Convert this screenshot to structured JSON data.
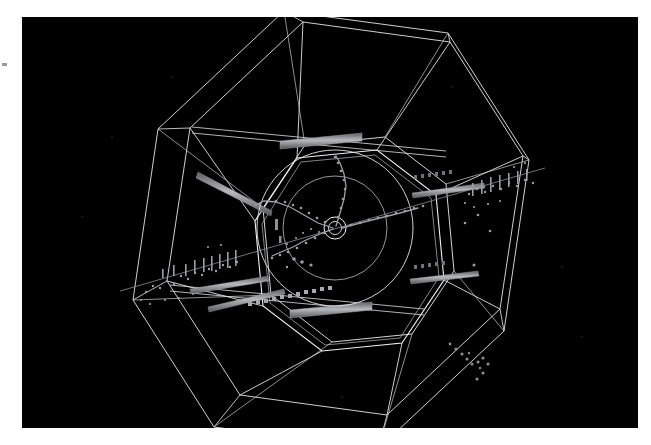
{
  "page": {
    "background_color": "#ffffff",
    "panel_background_color": "#000000",
    "wireframe_color": "#e8e8e8",
    "hit_color": "#9fa3a8",
    "track_color": "#b9bcc0",
    "calorimeter_bar_color": "#8e9196",
    "panel": {
      "x": 22,
      "y": 17,
      "width": 616,
      "height": 411
    }
  },
  "figure": {
    "kind": "particle-detector-event-display",
    "view": "end-on perspective, beam axis into the page",
    "interaction_point": {
      "x": 335,
      "y": 228
    }
  },
  "detector": {
    "sides": 8,
    "outer_octagon": {
      "name": "muon-chamber-outer-shell",
      "center": {
        "x": 333,
        "y": 230
      },
      "radius": 220,
      "rotation_deg": 22.5,
      "vertices": [
        {
          "x": 286,
          "y": 11
        },
        {
          "x": 450,
          "y": 33
        },
        {
          "x": 531,
          "y": 160
        },
        {
          "x": 506,
          "y": 331
        },
        {
          "x": 380,
          "y": 449
        },
        {
          "x": 216,
          "y": 427
        },
        {
          "x": 135,
          "y": 300
        },
        {
          "x": 160,
          "y": 129
        }
      ]
    },
    "front_octagon": {
      "name": "muon-chamber-front-face",
      "center": {
        "x": 355,
        "y": 213
      },
      "radius": 197,
      "rotation_deg": 22.5
    },
    "inner_octagon": {
      "name": "calorimeter-inner-octagon",
      "center": {
        "x": 335,
        "y": 228
      },
      "radius": 95,
      "rotation_deg": 22.5
    },
    "inner_octagon_back": {
      "name": "calorimeter-inner-octagon-back",
      "center": {
        "x": 345,
        "y": 220
      },
      "radius": 103,
      "rotation_deg": 22.5
    },
    "tracking_circles": [
      {
        "name": "tracker-outer-radius",
        "cx": 335,
        "cy": 228,
        "r": 78
      },
      {
        "name": "tracker-inner-radius",
        "cx": 335,
        "cy": 228,
        "r": 52
      },
      {
        "name": "beampipe-outer",
        "cx": 335,
        "cy": 228,
        "r": 10
      },
      {
        "name": "beampipe-inner",
        "cx": 335,
        "cy": 228,
        "r": 6
      }
    ],
    "calorimeter_bars": [
      {
        "name": "calorimeter-bar-upper-left",
        "x1": 196,
        "y1": 168,
        "x2": 268,
        "y2": 206
      },
      {
        "name": "calorimeter-bar-lower-left",
        "x1": 186,
        "y1": 278,
        "x2": 266,
        "y2": 263
      },
      {
        "name": "calorimeter-bar-lower-left-2",
        "x1": 206,
        "y1": 296,
        "x2": 282,
        "y2": 276
      },
      {
        "name": "calorimeter-bar-right",
        "x1": 406,
        "y1": 186,
        "x2": 478,
        "y2": 176
      },
      {
        "name": "calorimeter-bar-right-lower",
        "x1": 404,
        "y1": 272,
        "x2": 470,
        "y2": 264
      }
    ]
  },
  "event": {
    "beam_track": {
      "name": "through-going-muon-track",
      "x1": 120,
      "y1": 291,
      "x2": 545,
      "y2": 168
    },
    "track_hit_groups": [
      {
        "name": "muon-hits-left-chamber",
        "count": 28,
        "region": {
          "x": 140,
          "y": 252,
          "width": 105,
          "height": 46
        }
      },
      {
        "name": "muon-hits-right-chamber",
        "count": 30,
        "region": {
          "x": 455,
          "y": 170,
          "width": 95,
          "height": 45
        }
      },
      {
        "name": "hits-lower-right-sector",
        "count": 12,
        "region": {
          "x": 425,
          "y": 330,
          "width": 45,
          "height": 40
        }
      },
      {
        "name": "tracker-hits-central",
        "count": 60,
        "region": {
          "x": 280,
          "y": 185,
          "width": 110,
          "height": 85
        }
      }
    ],
    "reconstructed_tracks": [
      {
        "name": "track-upper-curving",
        "points": "336,227 340,213 344,199 346,186 344,174 340,163 336,156"
      },
      {
        "name": "track-left-arc",
        "points": "333,228 316,222 302,213 288,205 274,200 262,199 253,203"
      },
      {
        "name": "track-lower-left",
        "points": "333,229 320,234 306,240 293,247 281,252 272,256"
      },
      {
        "name": "track-right-outgoing",
        "points": "340,228 358,223 378,217 398,212 416,207"
      }
    ]
  },
  "annotations": {
    "margin_mark": {
      "name": "edge-registration-mark",
      "x": 2,
      "y": 63
    }
  }
}
